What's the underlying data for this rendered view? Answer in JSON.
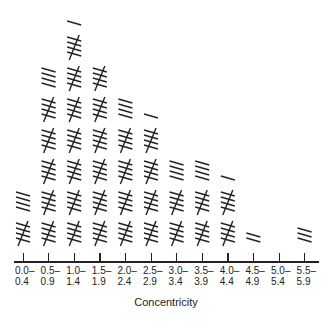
{
  "chart_data": {
    "type": "bar",
    "style": "tally-marks",
    "title": "",
    "xlabel": "Concentricity",
    "ylabel": "",
    "categories": [
      "0.0–0.4",
      "0.5–0.9",
      "1.0–1.4",
      "1.5–1.9",
      "2.0–2.4",
      "2.5–2.9",
      "3.0–3.4",
      "3.5–3.9",
      "4.0–4.4",
      "4.5–4.9",
      "5.0–5.4",
      "5.5–5.9"
    ],
    "tick_labels": [
      {
        "top": "0.0–",
        "bottom": "0.4"
      },
      {
        "top": "0.5–",
        "bottom": "0.9"
      },
      {
        "top": "1.0–",
        "bottom": "1.4"
      },
      {
        "top": "1.5–",
        "bottom": "1.9"
      },
      {
        "top": "2.0–",
        "bottom": "2.4"
      },
      {
        "top": "2.5–",
        "bottom": "2.9"
      },
      {
        "top": "3.0–",
        "bottom": "3.4"
      },
      {
        "top": "3.5–",
        "bottom": "3.9"
      },
      {
        "top": "4.0–",
        "bottom": "4.4"
      },
      {
        "top": "4.5–",
        "bottom": "4.9"
      },
      {
        "top": "5.0–",
        "bottom": "5.4"
      },
      {
        "top": "5.5–",
        "bottom": "5.9"
      }
    ],
    "values": [
      9,
      29,
      36,
      30,
      24,
      21,
      14,
      14,
      11,
      2,
      0,
      3
    ],
    "grid": false,
    "legend": null
  },
  "colors": {
    "ink": "#222222",
    "background": "#ffffff"
  }
}
